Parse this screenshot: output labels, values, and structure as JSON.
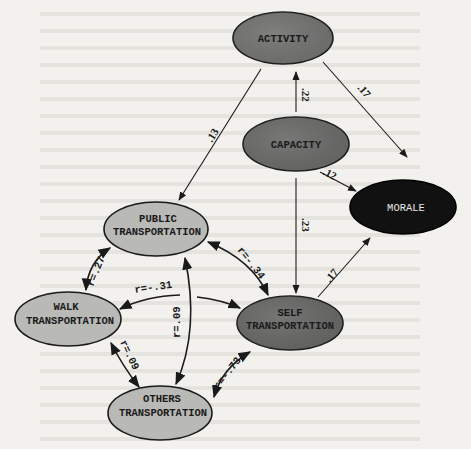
{
  "diagram": {
    "type": "path-model",
    "nodes": {
      "activity": {
        "label": "ACTIVITY",
        "fill": "#7a7a78"
      },
      "capacity": {
        "label": "CAPACITY",
        "fill": "#6f6f6d"
      },
      "morale": {
        "label": "MORALE",
        "fill": "#111111"
      },
      "public": {
        "line1": "PUBLIC",
        "line2": "TRANSPORTATION",
        "fill": "#b9b9b6"
      },
      "walk": {
        "line1": "WALK",
        "line2": "TRANSPORTATION",
        "fill": "#b9b9b6"
      },
      "self": {
        "line1": "SELF",
        "line2": "TRANSPORTATION",
        "fill": "#6c6c6a"
      },
      "others": {
        "line1": "OTHERS",
        "line2": "TRANSPORTATION",
        "fill": "#b9b9b6"
      }
    },
    "paths": [
      {
        "from": "capacity",
        "to": "activity",
        "label": ".22"
      },
      {
        "from": "activity",
        "to": "morale",
        "label": ".17"
      },
      {
        "from": "activity",
        "to": "public",
        "label": ".13"
      },
      {
        "from": "capacity",
        "to": "morale",
        "label": ".12"
      },
      {
        "from": "capacity",
        "to": "self",
        "label": ".23"
      },
      {
        "from": "self",
        "to": "morale",
        "label": ".17"
      }
    ],
    "correlations": [
      {
        "a": "public",
        "b": "walk",
        "label": "r=.27"
      },
      {
        "a": "public",
        "b": "self",
        "label": "r=-.34"
      },
      {
        "a": "walk",
        "b": "self",
        "label": "r=-.31"
      },
      {
        "a": "public",
        "b": "others",
        "label": "r=.09"
      },
      {
        "a": "walk",
        "b": "others",
        "label": "r=.09"
      },
      {
        "a": "self",
        "b": "others",
        "label": "r=-.73"
      }
    ]
  }
}
